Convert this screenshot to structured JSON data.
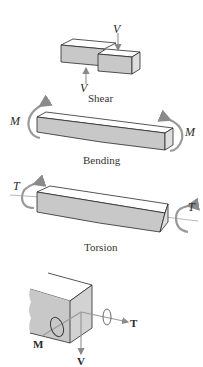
{
  "diagram": {
    "panels": [
      {
        "id": "shear",
        "caption": "Shear",
        "labels": {
          "top_force": "V",
          "bottom_force": "V"
        }
      },
      {
        "id": "bending",
        "caption": "Bending",
        "labels": {
          "left_moment": "M",
          "right_moment": "M"
        }
      },
      {
        "id": "torsion",
        "caption": "Torsion",
        "labels": {
          "left_torque": "T",
          "right_torque": "T"
        }
      },
      {
        "id": "combined",
        "caption": "",
        "labels": {
          "torque": "T",
          "moment": "M",
          "shear": "V"
        }
      }
    ],
    "colors": {
      "face_fill": "#c8c8c8",
      "top_fill": "#ffffff",
      "side_fill": "#d8d8d8",
      "stroke": "#2a2a2a",
      "arrow": "#9a9a9a"
    }
  }
}
